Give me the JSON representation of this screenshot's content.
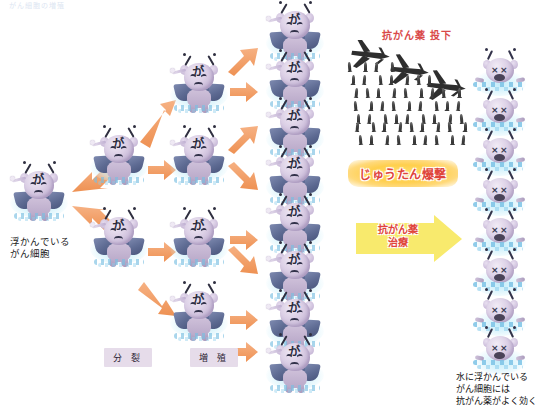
{
  "page": {
    "header_faint": "がん細胞の増殖"
  },
  "labels": {
    "floating_cancer_cells": "浮かんでいる\nがん細胞",
    "floating_cancer_cells_line1": "浮かんでいる",
    "floating_cancer_cells_line2": "がん細胞",
    "division": "分 裂",
    "proliferation": "増 殖",
    "drug_drop": "抗がん薬 投下",
    "carpet_bombing": "じゅうたん爆撃",
    "treatment_line1": "抗がん薬",
    "treatment_line2": "治療",
    "conclusion_line1": "水に浮かんでいる",
    "conclusion_line2": "がん細胞には",
    "conclusion_line3": "抗がん薬がよく効く"
  },
  "cell": {
    "kanji": "が",
    "dead_eye": "×"
  },
  "colors": {
    "arrow_orange": "#f0a06a",
    "banner_yellow": "#ffd24d",
    "banner_text_red": "#e0453b",
    "label_box_lavender": "#e6dcea",
    "cell_body_purple": "#c2b2d3",
    "tube_navy": "#5d6a92",
    "water_blue": "#7dc3e6",
    "treatment_arrow_yellow": "#f7e96b",
    "drop_text_red": "#d94a4a"
  },
  "diagram": {
    "type": "binary-proliferation-tree",
    "generations": [
      1,
      2,
      4,
      8
    ],
    "alive_cells_total": 15,
    "dead_cells_total": 8,
    "bomber_count": 3,
    "stage_labels": [
      "分 裂",
      "増 殖"
    ]
  },
  "cells_alive": [
    {
      "id": "gen1-1",
      "x": 8,
      "y": 164,
      "gen": 1
    },
    {
      "id": "gen2-1",
      "x": 88,
      "y": 128,
      "gen": 2
    },
    {
      "id": "gen2-2",
      "x": 88,
      "y": 210,
      "gen": 2
    },
    {
      "id": "gen3-1",
      "x": 168,
      "y": 128,
      "gen": 3
    },
    {
      "id": "gen3-2",
      "x": 168,
      "y": 210,
      "gen": 3
    },
    {
      "id": "gen3-3",
      "x": 168,
      "y": 56,
      "gen": 3
    },
    {
      "id": "gen3-4",
      "x": 168,
      "y": 284,
      "gen": 3
    },
    {
      "id": "gen4-1",
      "x": 264,
      "y": 4,
      "gen": 4
    },
    {
      "id": "gen4-2",
      "x": 264,
      "y": 52,
      "gen": 4
    },
    {
      "id": "gen4-3",
      "x": 264,
      "y": 100,
      "gen": 4
    },
    {
      "id": "gen4-4",
      "x": 264,
      "y": 148,
      "gen": 4
    },
    {
      "id": "gen4-5",
      "x": 264,
      "y": 196,
      "gen": 4
    },
    {
      "id": "gen4-6",
      "x": 264,
      "y": 244,
      "gen": 4
    },
    {
      "id": "gen4-7",
      "x": 264,
      "y": 292,
      "gen": 4
    },
    {
      "id": "gen4-8",
      "x": 264,
      "y": 336,
      "gen": 4
    }
  ],
  "cells_dead": [
    {
      "id": "dead-1",
      "x": 472,
      "y": 52
    },
    {
      "id": "dead-2",
      "x": 472,
      "y": 92
    },
    {
      "id": "dead-3",
      "x": 472,
      "y": 132
    },
    {
      "id": "dead-4",
      "x": 472,
      "y": 172
    },
    {
      "id": "dead-5",
      "x": 472,
      "y": 212
    },
    {
      "id": "dead-6",
      "x": 472,
      "y": 252
    },
    {
      "id": "dead-7",
      "x": 472,
      "y": 292
    },
    {
      "id": "dead-8",
      "x": 472,
      "y": 330
    }
  ]
}
